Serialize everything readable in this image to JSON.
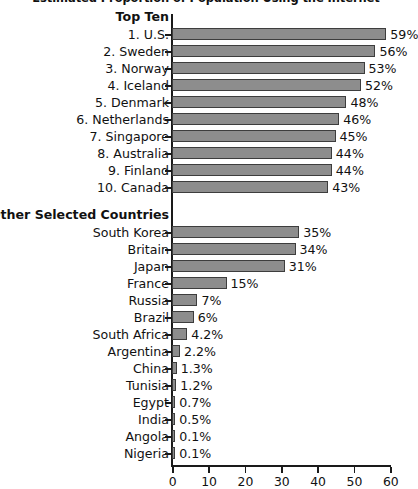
{
  "chart_data": {
    "type": "bar",
    "orientation": "horizontal",
    "title": "Estimated Proportion of Population Using the Internet",
    "xlabel": "",
    "ylabel": "",
    "xlim": [
      0,
      60
    ],
    "xticks": [
      0,
      10,
      20,
      30,
      40,
      50,
      60
    ],
    "xtick_labels": [
      "0",
      "10",
      "20",
      "30",
      "40",
      "50",
      "60"
    ],
    "grid": false,
    "legend": false,
    "value_suffix": "%",
    "bar_color": "#8d8d8d",
    "bar_border_color": "#3d3d3d",
    "axis_color": "#1a1a1a",
    "groups": [
      {
        "heading": "Top Ten",
        "categories": [
          "1. U.S.",
          "2. Sweden",
          "3. Norway",
          "4. Iceland",
          "5. Denmark",
          "6. Netherlands",
          "7. Singapore",
          "8. Australia",
          "9. Finland",
          "10. Canada"
        ],
        "values": [
          59,
          56,
          53,
          52,
          48,
          46,
          45,
          44,
          44,
          43
        ],
        "value_labels": [
          "59%",
          "56%",
          "53%",
          "52%",
          "48%",
          "46%",
          "45%",
          "44%",
          "44%",
          "43%"
        ]
      },
      {
        "heading": "Other Selected Countries",
        "categories": [
          "South Korea",
          "Britain",
          "Japan",
          "France",
          "Russia",
          "Brazil",
          "South Africa",
          "Argentina",
          "China",
          "Tunisia",
          "Egypt",
          "India",
          "Angola",
          "Nigeria"
        ],
        "values": [
          35,
          34,
          31,
          15,
          7,
          6,
          4.2,
          2.2,
          1.3,
          1.2,
          0.7,
          0.5,
          0.1,
          0.1
        ],
        "value_labels": [
          "35%",
          "34%",
          "31%",
          "15%",
          "7%",
          "6%",
          "4.2%",
          "2.2%",
          "1.3%",
          "1.2%",
          "0.7%",
          "0.5%",
          "0.1%",
          "0.1%"
        ]
      }
    ]
  }
}
